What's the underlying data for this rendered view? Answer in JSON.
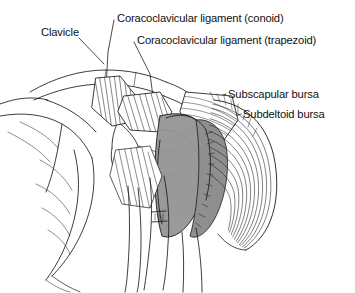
{
  "figure": {
    "type": "anatomical-illustration",
    "style": "black-and-white line drawing with grey shaded bursae",
    "background_color": "#ffffff",
    "line_color": "#1a1a1a",
    "bursa_fill_color": "#9a9a9a",
    "bursa_fill_color_dark": "#8a8a8a",
    "labels": [
      {
        "id": "clavicle",
        "text": "Clavicle"
      },
      {
        "id": "conoid",
        "text": "Coracoclavicular ligament (conoid)"
      },
      {
        "id": "trapezoid",
        "text": "Coracoclavicular ligament (trapezoid)"
      },
      {
        "id": "subscap",
        "text": "Subscapular bursa"
      },
      {
        "id": "subdelt",
        "text": "Subdeltoid bursa"
      }
    ]
  }
}
